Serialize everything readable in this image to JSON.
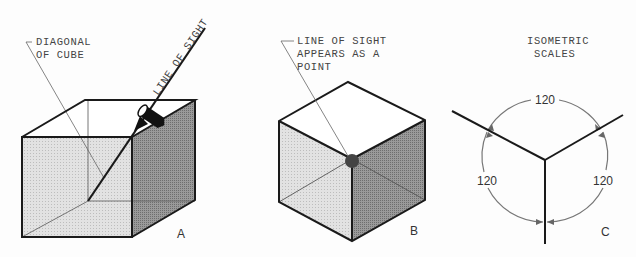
{
  "figures": [
    {
      "id": "A",
      "label": "A",
      "annotations": {
        "diagonal": [
          "DIAGONAL",
          "OF CUBE"
        ],
        "line_of_sight": "LINE OF SIGHT"
      }
    },
    {
      "id": "B",
      "label": "B",
      "annotations": {
        "point": [
          "LINE OF SIGHT",
          "APPEARS AS A",
          "POINT"
        ]
      }
    },
    {
      "id": "C",
      "label": "C",
      "title": [
        "ISOMETRIC",
        "SCALES"
      ],
      "angles": [
        "120",
        "120",
        "120"
      ]
    }
  ],
  "colors": {
    "line": "#1a1a1a",
    "thin_line": "#666666",
    "face_light": "#d9d9d9",
    "face_dark": "#8e8e8e",
    "face_top": "#ffffff"
  }
}
